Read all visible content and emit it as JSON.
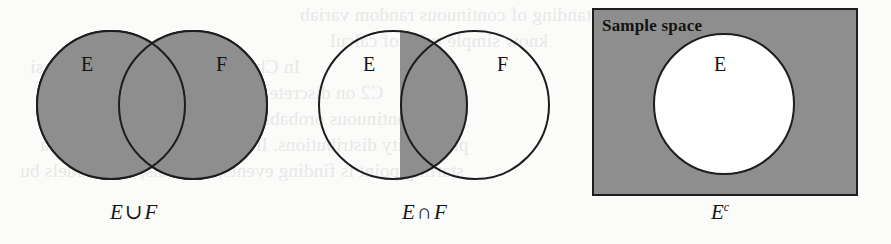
{
  "figure": {
    "background_color": "#fbfbfa",
    "shade_color": "#8e8e8e",
    "line_color": "#1d1d1d"
  },
  "panels": [
    {
      "id": "union",
      "caption_left": "E",
      "caption_operator": "∪",
      "caption_right": "F",
      "caption_plain": "E ∪ F",
      "shaded_region": "both circles",
      "labels": [
        {
          "text": "E",
          "x": 85,
          "y": 55
        },
        {
          "text": "F",
          "x": 219,
          "y": 55
        }
      ],
      "circles": [
        {
          "name": "E",
          "cx": 111,
          "cy": 105,
          "r": 75,
          "fill": "#8e8e8e"
        },
        {
          "name": "F",
          "cx": 193,
          "cy": 105,
          "r": 75,
          "fill": "#8e8e8e"
        }
      ]
    },
    {
      "id": "intersection",
      "caption_left": "E",
      "caption_operator": "∩",
      "caption_right": "F",
      "caption_plain": "E ∩ F",
      "shaded_region": "lens overlap only",
      "labels": [
        {
          "text": "E",
          "x": 366,
          "y": 55
        },
        {
          "text": "F",
          "x": 500,
          "y": 55
        }
      ],
      "circles": [
        {
          "name": "E",
          "cx": 393,
          "cy": 105,
          "r": 75,
          "fill": "none"
        },
        {
          "name": "F",
          "cx": 475,
          "cy": 105,
          "r": 75,
          "fill": "none"
        }
      ]
    },
    {
      "id": "complement",
      "caption_left": "E",
      "caption_superscript": "c",
      "caption_plain": "Eᶜ",
      "shaded_region": "box outside circle",
      "box_label": "Sample space",
      "labels": [
        {
          "text": "E",
          "x": 718,
          "y": 55
        }
      ],
      "box": {
        "x": 592,
        "y": 8,
        "w": 266,
        "h": 188,
        "fill": "#8e8e8e"
      },
      "circles": [
        {
          "name": "E",
          "cx": 724,
          "cy": 104,
          "r": 71,
          "fill": "#ffffff"
        }
      ]
    }
  ],
  "captions": {
    "union": {
      "left": "E",
      "op": "∪",
      "right": "F"
    },
    "intersection": {
      "left": "E",
      "op": "∩",
      "right": "F"
    },
    "complement": {
      "base": "E",
      "sup": "c"
    }
  },
  "bleed_text": [
    {
      "text": "complete understanding of continuous random variab",
      "x": 300,
      "y": 4
    },
    {
      "text": "know simple rules of calcul",
      "x": 330,
      "y": 30
    },
    {
      "text": "In Chapter C1 we go over the basi",
      "x": 30,
      "y": 56
    },
    {
      "text": "C2 on discrete random variab",
      "x": 150,
      "y": 82
    },
    {
      "text": "continuous probability as well as brie",
      "x": 120,
      "y": 108
    },
    {
      "text": "probability distributions. In discussing Section C3, sta",
      "x": 40,
      "y": 134
    },
    {
      "text": "starting point is finding events, intervals, and models bu",
      "x": 20,
      "y": 160
    }
  ]
}
